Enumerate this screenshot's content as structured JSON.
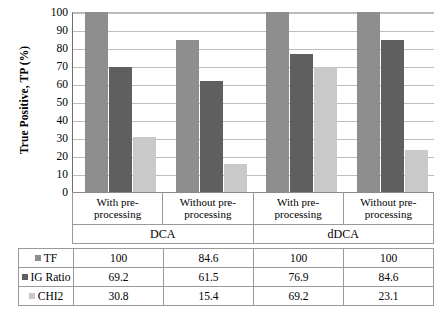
{
  "chart_data": {
    "type": "bar",
    "title": "",
    "xlabel": "",
    "ylabel": "True Positive, TP (%)",
    "ylim": [
      0,
      100
    ],
    "ytick_step": 10,
    "grid": true,
    "legend_position": "table-row-headers",
    "yticks": [
      "100",
      "90",
      "80",
      "70",
      "60",
      "50",
      "40",
      "30",
      "20",
      "10",
      "0"
    ],
    "categories": [
      "With pre-processing",
      "Without pre-processing",
      "With pre-processing",
      "Without pre-processing"
    ],
    "category_lines": [
      [
        "With pre-",
        "processing"
      ],
      [
        "Without pre-",
        "processing"
      ],
      [
        "With pre-",
        "processing"
      ],
      [
        "Without pre-",
        "processing"
      ]
    ],
    "groups": [
      {
        "label": "DCA",
        "span": 2
      },
      {
        "label": "dDCA",
        "span": 2
      }
    ],
    "series": [
      {
        "name": "TF",
        "color": "#8e8e8e",
        "values": [
          100,
          84.6,
          100,
          100
        ]
      },
      {
        "name": "IG Ratio",
        "color": "#5f5f5f",
        "values": [
          69.2,
          61.5,
          76.9,
          84.6
        ]
      },
      {
        "name": "CHI2",
        "color": "#c9c9c9",
        "values": [
          30.8,
          15.4,
          69.2,
          23.1
        ]
      }
    ]
  },
  "table": {
    "rows": [
      {
        "label": "TF",
        "swatch": "tf",
        "cells": [
          "100",
          "84.6",
          "100",
          "100"
        ]
      },
      {
        "label": "IG Ratio",
        "swatch": "ig",
        "cells": [
          "69.2",
          "61.5",
          "76.9",
          "84.6"
        ]
      },
      {
        "label": "CHI2",
        "swatch": "chi2",
        "cells": [
          "30.8",
          "15.4",
          "69.2",
          "23.1"
        ]
      }
    ]
  }
}
